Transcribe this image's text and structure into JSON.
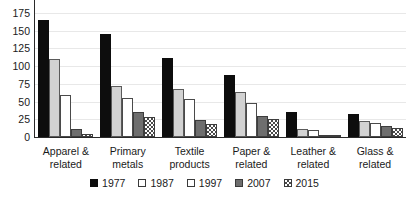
{
  "chart_data": {
    "type": "bar",
    "title": "",
    "subtitle": "",
    "xlabel": "",
    "ylabel": "",
    "ylim": [
      0,
      175
    ],
    "yticks": [
      0,
      25,
      50,
      75,
      100,
      125,
      150,
      175
    ],
    "grid": true,
    "legend_position": "bottom",
    "categories": [
      "Apparel & related",
      "Primary metals",
      "Textile products",
      "Paper & related",
      "Leather & related",
      "Glass & related"
    ],
    "category_lines": [
      [
        "Apparel &",
        "related"
      ],
      [
        "Primary",
        "metals"
      ],
      [
        "Textile",
        "products"
      ],
      [
        "Paper &",
        "related"
      ],
      [
        "Leather &",
        "related"
      ],
      [
        "Glass &",
        "related"
      ]
    ],
    "series": [
      {
        "name": "1977",
        "style": "solid-black",
        "color": "#0d0d0d",
        "values": [
          165,
          145,
          112,
          88,
          35,
          32
        ]
      },
      {
        "name": "1987",
        "style": "light-gray",
        "color": "#d2d2d2",
        "values": [
          110,
          72,
          68,
          63,
          12,
          22
        ]
      },
      {
        "name": "1997",
        "style": "white",
        "color": "#ffffff",
        "values": [
          60,
          55,
          53,
          48,
          10,
          20
        ]
      },
      {
        "name": "2007",
        "style": "dark-gray",
        "color": "#6e6e6e",
        "values": [
          12,
          35,
          24,
          30,
          3,
          15
        ]
      },
      {
        "name": "2015",
        "style": "hatched",
        "color": "#4a4a4a",
        "values": [
          4,
          28,
          18,
          26,
          2,
          13
        ]
      }
    ]
  }
}
